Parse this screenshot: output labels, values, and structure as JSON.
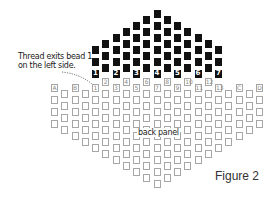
{
  "annotation": {
    "line1": "Thread exits bead 1",
    "line2": "on the left side."
  },
  "panel_label": "back panel",
  "figure_label": "Figure 2",
  "colors": {
    "black_bead": "#111111",
    "white_bead_border": "#a6a6a6",
    "label_black": "#ffffff",
    "label_white": "#8a8a8a"
  },
  "black_grid": {
    "columns": [
      {
        "label": "1",
        "height": 3
      },
      {
        "label": "",
        "height": 3
      },
      {
        "label": "2",
        "height": 4
      },
      {
        "label": "",
        "height": 4
      },
      {
        "label": "3",
        "height": 5
      },
      {
        "label": "",
        "height": 5
      },
      {
        "label": "4",
        "height": 6
      },
      {
        "label": "",
        "height": 5
      },
      {
        "label": "5",
        "height": 5
      },
      {
        "label": "",
        "height": 4
      },
      {
        "label": "6",
        "height": 4
      },
      {
        "label": "",
        "height": 3
      },
      {
        "label": "7",
        "height": 3
      }
    ]
  },
  "white_grid": {
    "columns": [
      {
        "label": "A"
      },
      {
        "label": ""
      },
      {
        "label": "B"
      },
      {
        "label": ""
      },
      {
        "label": "1"
      },
      {
        "label": "2"
      },
      {
        "label": "3"
      },
      {
        "label": "4"
      },
      {
        "label": "5"
      },
      {
        "label": "6"
      },
      {
        "label": "7"
      },
      {
        "label": "8"
      },
      {
        "label": "9"
      },
      {
        "label": "10"
      },
      {
        "label": "11"
      },
      {
        "label": "12"
      },
      {
        "label": "13"
      },
      {
        "label": ""
      },
      {
        "label": "C"
      },
      {
        "label": ""
      },
      {
        "label": "D"
      }
    ]
  }
}
